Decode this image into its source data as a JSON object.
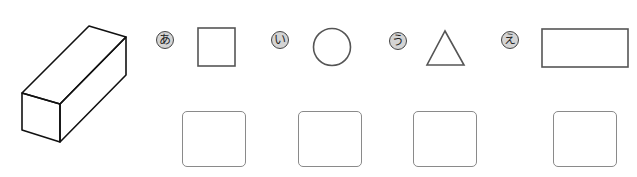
{
  "figure": {
    "solid": {
      "name": "rectangular-prism",
      "stroke": "#111111"
    },
    "options": [
      {
        "label": "あ",
        "shape": "square"
      },
      {
        "label": "い",
        "shape": "circle"
      },
      {
        "label": "う",
        "shape": "triangle"
      },
      {
        "label": "え",
        "shape": "rectangle"
      }
    ],
    "answer_boxes": [
      {
        "value": ""
      },
      {
        "value": ""
      },
      {
        "value": ""
      },
      {
        "value": ""
      }
    ],
    "colors": {
      "shape_stroke": "#555555",
      "badge_fill": "#d4d4d4",
      "box_stroke": "#8a8a8a"
    }
  }
}
